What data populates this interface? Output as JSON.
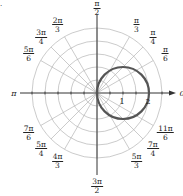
{
  "figure": {
    "corner_mark": ".",
    "origin": {
      "x": 97,
      "y": 93
    },
    "unit_px": 26,
    "grid_circle_step": 0.5,
    "grid_circle_count": 5,
    "grid_color": "#b5b5b5",
    "axis_color": "#333333",
    "curve_color": "#555555",
    "axis_label_zero": "0",
    "axis_label_pi": "π",
    "radial_labels": [
      {
        "text": "1",
        "r": 1
      },
      {
        "text": "2",
        "r": 2
      }
    ],
    "angle_labels": [
      {
        "key": "pi_over_6",
        "num": "π",
        "den": "6",
        "deg": 30
      },
      {
        "key": "pi_over_4",
        "num": "π",
        "den": "4",
        "deg": 45
      },
      {
        "key": "pi_over_3",
        "num": "π",
        "den": "3",
        "deg": 60
      },
      {
        "key": "pi_over_2",
        "num": "π",
        "den": "2",
        "deg": 90
      },
      {
        "key": "2pi_over_3",
        "num": "2π",
        "den": "3",
        "deg": 120
      },
      {
        "key": "3pi_over_4",
        "num": "3π",
        "den": "4",
        "deg": 135
      },
      {
        "key": "5pi_over_6",
        "num": "5π",
        "den": "6",
        "deg": 150
      },
      {
        "key": "7pi_over_6",
        "num": "7π",
        "den": "6",
        "deg": 210
      },
      {
        "key": "5pi_over_4",
        "num": "5π",
        "den": "4",
        "deg": 225
      },
      {
        "key": "4pi_over_3",
        "num": "4π",
        "den": "3",
        "deg": 240
      },
      {
        "key": "3pi_over_2",
        "num": "3π",
        "den": "2",
        "deg": 270
      },
      {
        "key": "5pi_over_3",
        "num": "5π",
        "den": "3",
        "deg": 300
      },
      {
        "key": "7pi_over_4",
        "num": "7π",
        "den": "4",
        "deg": 315
      },
      {
        "key": "11pi_over_6",
        "num": "11π",
        "den": "6",
        "deg": 330
      }
    ],
    "curve": {
      "type": "polar",
      "equation": "r = 2cos θ",
      "center_r": 1,
      "radius": 1
    }
  }
}
